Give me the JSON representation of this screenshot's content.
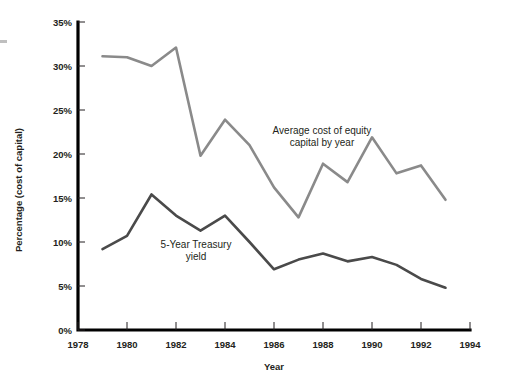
{
  "chart_data": {
    "type": "line",
    "title": "",
    "xlabel": "Year",
    "ylabel": "Percentage (cost of capital)",
    "xlim": [
      1978,
      1994
    ],
    "ylim": [
      0,
      35
    ],
    "grid": false,
    "legend_position": "inline-annotations",
    "x": [
      1979,
      1980,
      1981,
      1982,
      1983,
      1984,
      1985,
      1986,
      1987,
      1988,
      1989,
      1990,
      1991,
      1992,
      1993
    ],
    "xticks": [
      "1978",
      "1980",
      "1982",
      "1984",
      "1986",
      "1988",
      "1990",
      "1992",
      "1994"
    ],
    "xtick_values": [
      1978,
      1980,
      1982,
      1984,
      1986,
      1988,
      1990,
      1992,
      1994
    ],
    "yticks": [
      "0%",
      "5%",
      "10%",
      "15%",
      "20%",
      "25%",
      "30%",
      "35%"
    ],
    "ytick_values": [
      0,
      5,
      10,
      15,
      20,
      25,
      30,
      35
    ],
    "series": [
      {
        "name": "Average cost of equity capital by year",
        "color": "#8a8a8a",
        "values": [
          31.1,
          31.0,
          30.0,
          32.1,
          19.8,
          23.9,
          21.0,
          16.2,
          12.8,
          18.9,
          16.8,
          21.9,
          17.8,
          18.7,
          14.8
        ]
      },
      {
        "name": "5-Year Treasury yield",
        "color": "#4a4a4a",
        "values": [
          9.2,
          10.7,
          15.4,
          13.0,
          11.3,
          13.0,
          10.0,
          6.9,
          8.0,
          8.7,
          7.8,
          8.3,
          7.4,
          5.8,
          4.8
        ]
      }
    ],
    "annotations": [
      {
        "name": "equity-cost-annotation",
        "line1": "Average cost of equity",
        "line2": "capital by year",
        "x": 322,
        "y": 134
      },
      {
        "name": "treasury-yield-annotation",
        "line1": "5-Year Treasury",
        "line2": "yield",
        "x": 196,
        "y": 248
      }
    ]
  }
}
